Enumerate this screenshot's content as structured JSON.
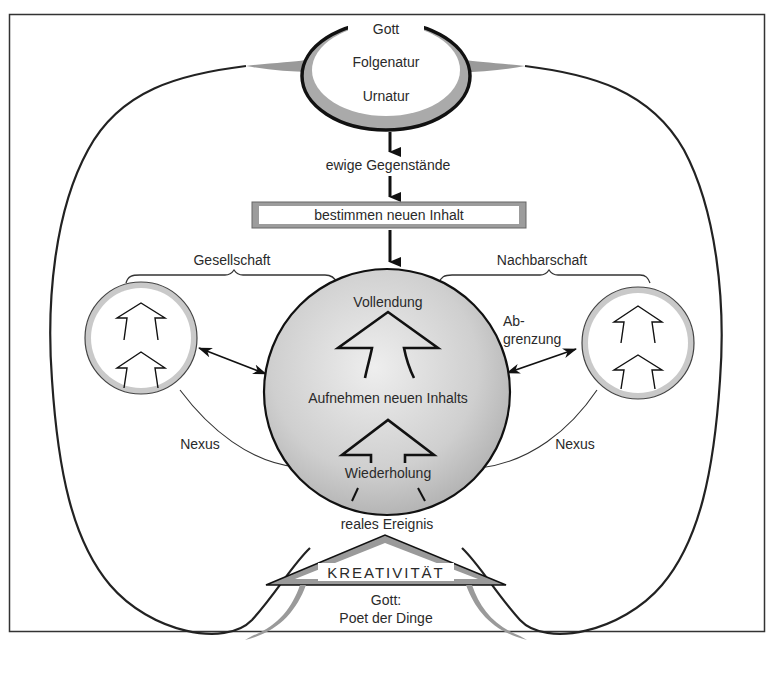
{
  "diagram": {
    "type": "process-philosophy-diagram",
    "god_node": {
      "title": "Gott",
      "line2": "Folgenatur",
      "line3": "Urnatur"
    },
    "flow": {
      "eternal_objects": "ewige Gegenstände",
      "determine_box": "bestimmen neuen Inhalt"
    },
    "central_circle": {
      "top": "Vollendung",
      "middle": "Aufnehmen neuen Inhalts",
      "bottom": "Wiederholung"
    },
    "left_group": {
      "brace_label": "Gesellschaft",
      "nexus_label": "Nexus"
    },
    "right_group": {
      "brace_label": "Nachbarschaft",
      "boundary_label_line1": "Ab-",
      "boundary_label_line2": "grenzung",
      "nexus_label": "Nexus"
    },
    "bottom": {
      "event_label": "reales Ereignis",
      "creativity_label": "KREATIVITÄT",
      "god_poet_line1": "Gott:",
      "god_poet_line2": "Poet der Dinge"
    },
    "colors": {
      "stroke": "#1a1a1a",
      "gray_fill": "#bdbdbd",
      "light_fill": "#e2e2e2",
      "frame": "#333333"
    }
  }
}
